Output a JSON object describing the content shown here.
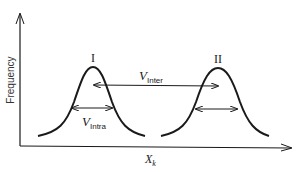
{
  "diagram": {
    "y_axis_label": "Frequency",
    "x_axis_label": {
      "base": "X",
      "subscript": "k"
    },
    "peaks": [
      {
        "label": "I",
        "center_x": 93
      },
      {
        "label": "II",
        "center_x": 218
      }
    ],
    "inter_label": {
      "base": "V",
      "subscript": "Inter"
    },
    "intra_label": {
      "base": "V",
      "subscript": "Intra"
    },
    "colors": {
      "stroke": "#1a1a1a",
      "background": "#ffffff"
    }
  }
}
